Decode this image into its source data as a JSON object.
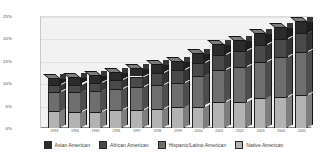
{
  "chart_data": {
    "type": "bar",
    "stacked": true,
    "three_d": true,
    "title": "",
    "subtitle": "",
    "xlabel": "",
    "ylabel": "",
    "ylim": [
      0,
      25
    ],
    "ytick_labels": [
      "0%",
      "5%",
      "10%",
      "15%",
      "20%",
      "25%"
    ],
    "ytick_values": [
      0,
      5,
      10,
      15,
      20,
      25
    ],
    "grid": true,
    "legend_position": "bottom",
    "categories": [
      "1993",
      "1994",
      "1995",
      "1996",
      "1997",
      "1998",
      "1999",
      "2000",
      "2001",
      "2002",
      "2003",
      "2004",
      "2005"
    ],
    "series": [
      {
        "name": "Native American",
        "color": "#b3b3b3",
        "values": [
          3.7,
          3.6,
          3.6,
          4.0,
          4.1,
          4.3,
          4.6,
          4.8,
          5.7,
          5.9,
          6.6,
          6.9,
          7.4
        ]
      },
      {
        "name": "Hispanic/Latino American",
        "color": "#6e6e6e",
        "values": [
          4.4,
          4.4,
          4.6,
          4.7,
          5.1,
          5.4,
          5.5,
          6.7,
          7.2,
          7.7,
          8.2,
          9.0,
          9.6
        ]
      },
      {
        "name": "African American",
        "color": "#4a4a4a",
        "values": [
          1.5,
          1.7,
          1.9,
          2.1,
          2.3,
          2.6,
          2.8,
          3.1,
          3.4,
          3.6,
          3.8,
          4.0,
          4.2
        ]
      },
      {
        "name": "Asian American",
        "color": "#2b2b2b",
        "values": [
          1.5,
          1.6,
          1.7,
          1.8,
          1.9,
          2.0,
          2.1,
          2.2,
          2.4,
          2.5,
          2.6,
          2.7,
          2.8
        ]
      }
    ],
    "totals": [
      11.1,
      11.3,
      11.8,
      12.6,
      13.4,
      14.3,
      15.0,
      16.8,
      18.7,
      19.7,
      21.2,
      22.6,
      24.0
    ]
  },
  "legend": {
    "items": [
      {
        "label": "Asian American",
        "color": "#2b2b2b"
      },
      {
        "label": "African American",
        "color": "#4a4a4a"
      },
      {
        "label": "Hispanic/Latino American",
        "color": "#6e6e6e"
      },
      {
        "label": "Native American",
        "color": "#b3b3b3"
      }
    ]
  }
}
